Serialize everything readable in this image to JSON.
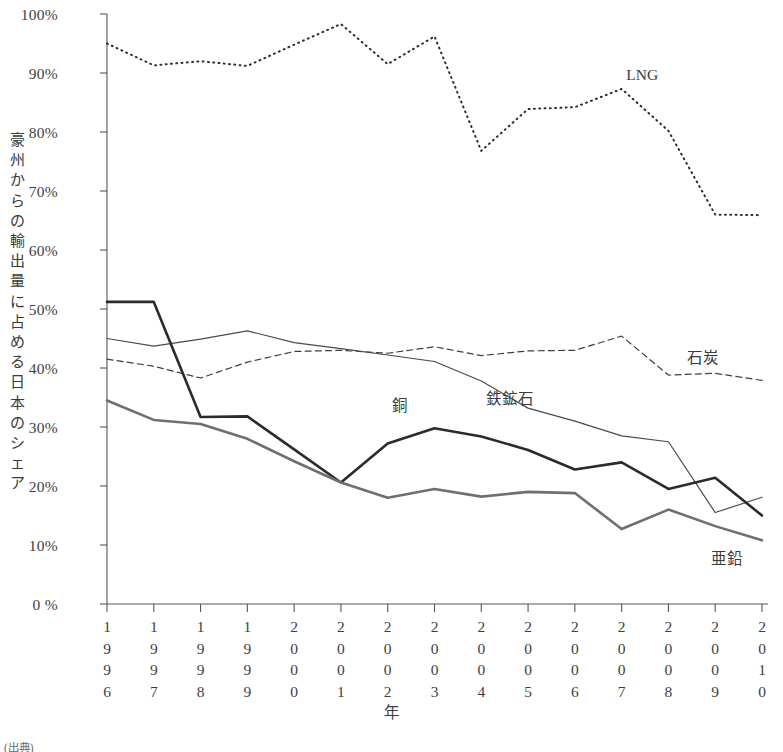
{
  "chart_data": {
    "type": "line",
    "title": "",
    "xlabel": "年",
    "ylabel": "豪州からの輸出量に占める日本のシェア",
    "x": [
      1996,
      1997,
      1998,
      1999,
      2000,
      2001,
      2002,
      2003,
      2004,
      2005,
      2006,
      2007,
      2008,
      2009,
      2010
    ],
    "categories": [
      "1996",
      "1997",
      "1998",
      "1999",
      "2000",
      "2001",
      "2002",
      "2003",
      "2004",
      "2005",
      "2006",
      "2007",
      "2008",
      "2009",
      "2010"
    ],
    "ylim": [
      0,
      100
    ],
    "xlim": [
      1996,
      2010
    ],
    "yticks": [
      0,
      10,
      20,
      30,
      40,
      50,
      60,
      70,
      80,
      90,
      100
    ],
    "ytick_labels": [
      "0 %",
      "10%",
      "20%",
      "30%",
      "40%",
      "50%",
      "60%",
      "70%",
      "80%",
      "90%",
      "100%"
    ],
    "grid": false,
    "legend_position": "inline-annotations",
    "units": "percent",
    "series": [
      {
        "name": "LNG",
        "style": "dotted",
        "color": "#2b2b2b",
        "width": 2.0,
        "values": [
          95.0,
          91.3,
          92.0,
          91.2,
          94.8,
          98.3,
          91.5,
          96.2,
          76.8,
          83.9,
          84.2,
          87.3,
          80.2,
          66.0,
          65.9
        ],
        "label_x": 2007.1,
        "label_y": 89.5
      },
      {
        "name": "石炭",
        "style": "dashed",
        "color": "#3f3f3f",
        "width": 1.2,
        "values": [
          41.5,
          40.3,
          38.3,
          41.0,
          42.8,
          43.0,
          42.5,
          43.6,
          42.1,
          42.9,
          43.0,
          45.4,
          38.8,
          39.1,
          37.9
        ],
        "label_x": 2008.4,
        "label_y": 42.2
      },
      {
        "name": "鉄鉱石",
        "style": "solid-thin",
        "color": "#4a4a4a",
        "width": 1.2,
        "values": [
          45.0,
          43.7,
          44.9,
          46.3,
          44.3,
          43.3,
          42.2,
          41.1,
          37.8,
          33.2,
          31.0,
          28.5,
          27.5,
          15.5,
          18.1
        ],
        "label_x": 2004.1,
        "label_y": 35.2
      },
      {
        "name": "銅",
        "style": "solid-thick",
        "color": "#2b2b2b",
        "width": 2.6,
        "values": [
          51.2,
          51.2,
          31.7,
          31.8,
          26.2,
          20.6,
          27.2,
          29.8,
          28.4,
          26.1,
          22.8,
          24.0,
          19.5,
          21.4,
          15.0
        ],
        "label_x": 2002.1,
        "label_y": 34.0
      },
      {
        "name": "亜鉛",
        "style": "solid-thick-gray",
        "color": "#6f6f6f",
        "width": 2.6,
        "values": [
          34.5,
          31.2,
          30.5,
          28.0,
          24.2,
          20.6,
          18.0,
          19.5,
          18.2,
          19.0,
          18.8,
          12.7,
          16.0,
          13.2,
          10.8
        ],
        "label_x": 2008.9,
        "label_y": 8.2
      }
    ]
  },
  "axis": {
    "y_title_chars": [
      "豪",
      "州",
      "か",
      "ら",
      "の",
      "輸",
      "出",
      "量",
      "に",
      "占",
      "め",
      "る",
      "日",
      "本",
      "の",
      "シ",
      "ェ",
      "ア"
    ],
    "x_title": "年"
  },
  "source": {
    "note": "(出典)"
  }
}
